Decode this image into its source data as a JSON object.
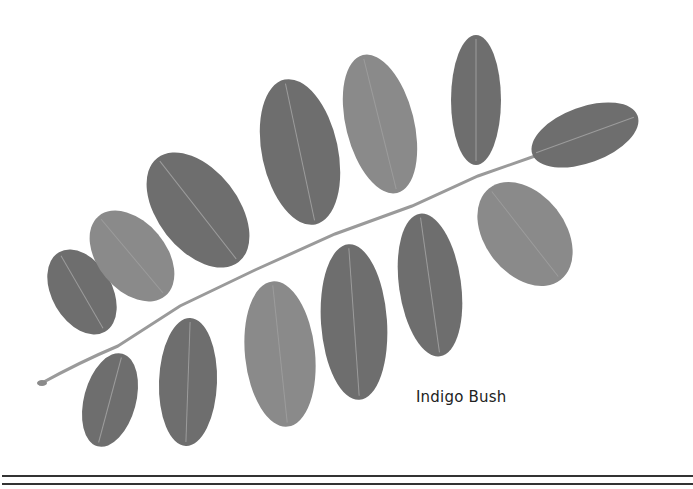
{
  "caption": "Indigo Bush",
  "colors": {
    "background": "#ffffff",
    "leaf": "#6e6e6e",
    "leaf_light": "#8a8a8a",
    "stem": "#9a9a9a",
    "rule": "#333333",
    "caption_text": "#222222"
  },
  "leaflets": [
    {
      "cx": 82,
      "cy": 292,
      "rx": 30,
      "ry": 46,
      "rot": -30
    },
    {
      "cx": 110,
      "cy": 400,
      "rx": 26,
      "ry": 48,
      "rot": 15
    },
    {
      "cx": 132,
      "cy": 256,
      "rx": 34,
      "ry": 52,
      "rot": -40
    },
    {
      "cx": 188,
      "cy": 382,
      "rx": 29,
      "ry": 64,
      "rot": 2
    },
    {
      "cx": 198,
      "cy": 210,
      "rx": 40,
      "ry": 66,
      "rot": -38
    },
    {
      "cx": 280,
      "cy": 354,
      "rx": 35,
      "ry": 73,
      "rot": -6
    },
    {
      "cx": 300,
      "cy": 152,
      "rx": 38,
      "ry": 74,
      "rot": -12
    },
    {
      "cx": 354,
      "cy": 322,
      "rx": 33,
      "ry": 78,
      "rot": -4
    },
    {
      "cx": 380,
      "cy": 124,
      "rx": 34,
      "ry": 71,
      "rot": -14
    },
    {
      "cx": 430,
      "cy": 285,
      "rx": 31,
      "ry": 72,
      "rot": -8
    },
    {
      "cx": 476,
      "cy": 100,
      "rx": 25,
      "ry": 65,
      "rot": 0
    },
    {
      "cx": 525,
      "cy": 234,
      "rx": 40,
      "ry": 58,
      "rot": -38
    },
    {
      "cx": 585,
      "cy": 135,
      "rx": 28,
      "ry": 56,
      "rot": 70
    }
  ]
}
